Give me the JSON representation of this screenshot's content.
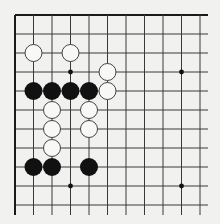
{
  "board": {
    "description": "Go board corner diagram (upper-left corner, top and left edges shown)",
    "columns": 11,
    "rows": 11,
    "origin_px": [
      15,
      15
    ],
    "spacing_px": [
      18.5,
      19
    ],
    "extend_right_px": 208,
    "extend_bottom_px": 215,
    "colors": {
      "background": "#f1f1ef",
      "line": "#3a3a3a",
      "edge": "#1a1a1a",
      "black_stone": "#111111",
      "white_stone_fill": "#f8f8f6",
      "white_stone_stroke": "#444444",
      "star_point": "#111111"
    },
    "star_points": [
      [
        3,
        3
      ],
      [
        9,
        3
      ],
      [
        3,
        9
      ],
      [
        9,
        9
      ]
    ],
    "stones": [
      {
        "color": "white",
        "col": 1,
        "row": 2
      },
      {
        "color": "white",
        "col": 3,
        "row": 2
      },
      {
        "color": "white",
        "col": 5,
        "row": 3
      },
      {
        "color": "black",
        "col": 1,
        "row": 4
      },
      {
        "color": "black",
        "col": 2,
        "row": 4
      },
      {
        "color": "black",
        "col": 3,
        "row": 4
      },
      {
        "color": "black",
        "col": 4,
        "row": 4
      },
      {
        "color": "white",
        "col": 5,
        "row": 4
      },
      {
        "color": "white",
        "col": 2,
        "row": 5
      },
      {
        "color": "white",
        "col": 4,
        "row": 5
      },
      {
        "color": "white",
        "col": 2,
        "row": 6
      },
      {
        "color": "white",
        "col": 4,
        "row": 6
      },
      {
        "color": "white",
        "col": 2,
        "row": 7
      },
      {
        "color": "black",
        "col": 1,
        "row": 8
      },
      {
        "color": "black",
        "col": 2,
        "row": 8
      },
      {
        "color": "black",
        "col": 4,
        "row": 8
      }
    ]
  }
}
